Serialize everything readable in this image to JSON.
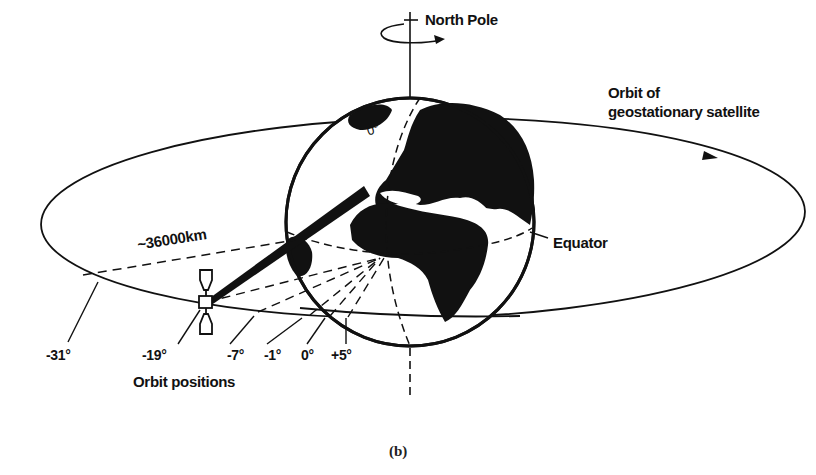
{
  "figure": {
    "caption": "(b)",
    "labels": {
      "north_pole": "North Pole",
      "orbit_line1": "Orbit of",
      "orbit_line2": "geostationary satellite",
      "equator": "Equator",
      "distance": "~36000km",
      "meridian": "0°",
      "orbit_positions": "Orbit positions"
    },
    "positions": [
      {
        "id": "m31",
        "label": "-31°"
      },
      {
        "id": "m19",
        "label": "-19°"
      },
      {
        "id": "m7",
        "label": "-7°"
      },
      {
        "id": "m1",
        "label": "-1°"
      },
      {
        "id": "z0",
        "label": "0°"
      },
      {
        "id": "p5",
        "label": "+5°"
      }
    ],
    "colors": {
      "ink": "#111111",
      "background": "#ffffff"
    }
  }
}
